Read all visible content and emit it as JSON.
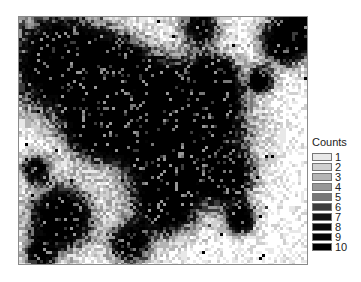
{
  "chart_data": {
    "type": "heatmap",
    "subtype": "hexbin-count-density",
    "title": "",
    "xlabel": "",
    "ylabel": "",
    "axes_ticks_shown": false,
    "grid": false,
    "legend": {
      "title": "Counts",
      "position": "right",
      "levels": [
        {
          "label": "1",
          "color": "#e8e8e8"
        },
        {
          "label": "2",
          "color": "#cfcfcf"
        },
        {
          "label": "3",
          "color": "#b4b4b4"
        },
        {
          "label": "4",
          "color": "#979797"
        },
        {
          "label": "5",
          "color": "#777777"
        },
        {
          "label": "6",
          "color": "#3c3c3c"
        },
        {
          "label": "7",
          "color": "#141414"
        },
        {
          "label": "8",
          "color": "#0a0a0a"
        },
        {
          "label": "9",
          "color": "#050505"
        },
        {
          "label": "10",
          "color": "#000000"
        }
      ]
    },
    "clusters_approx_plot_px": [
      {
        "x": 40,
        "y": 45,
        "r": 48,
        "peak": 10
      },
      {
        "x": 95,
        "y": 55,
        "r": 32,
        "peak": 9
      },
      {
        "x": 180,
        "y": 8,
        "r": 18,
        "peak": 7
      },
      {
        "x": 265,
        "y": 22,
        "r": 24,
        "peak": 9
      },
      {
        "x": 285,
        "y": 10,
        "r": 16,
        "peak": 8
      },
      {
        "x": 195,
        "y": 58,
        "r": 18,
        "peak": 9
      },
      {
        "x": 240,
        "y": 62,
        "r": 11,
        "peak": 9
      },
      {
        "x": 160,
        "y": 115,
        "r": 58,
        "peak": 10
      },
      {
        "x": 125,
        "y": 95,
        "r": 40,
        "peak": 10
      },
      {
        "x": 72,
        "y": 110,
        "r": 26,
        "peak": 9
      },
      {
        "x": 40,
        "y": 200,
        "r": 30,
        "peak": 10
      },
      {
        "x": 205,
        "y": 160,
        "r": 22,
        "peak": 9
      },
      {
        "x": 220,
        "y": 200,
        "r": 14,
        "peak": 9
      },
      {
        "x": 15,
        "y": 150,
        "r": 14,
        "peak": 7
      },
      {
        "x": 110,
        "y": 225,
        "r": 20,
        "peak": 8
      },
      {
        "x": 20,
        "y": 235,
        "r": 14,
        "peak": 7
      },
      {
        "x": 145,
        "y": 185,
        "r": 28,
        "peak": 9
      },
      {
        "x": 180,
        "y": 85,
        "r": 30,
        "peak": 10
      }
    ],
    "plot_width_px": 290,
    "plot_height_px": 249,
    "cell_px": 3
  }
}
